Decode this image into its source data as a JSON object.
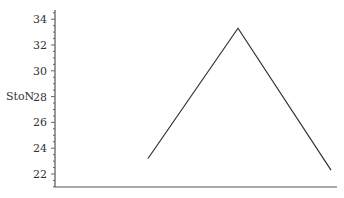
{
  "chart_data": {
    "type": "line",
    "title": "",
    "xlabel": "",
    "ylabel": "StoN",
    "ylim": [
      21,
      35
    ],
    "yticks": [
      22,
      24,
      26,
      28,
      30,
      32,
      34
    ],
    "grid": false,
    "legend": null,
    "series": [
      {
        "name": "StoN",
        "x": [
          1,
          2,
          3
        ],
        "values": [
          23.2,
          33.3,
          22.3
        ],
        "color": "#333333"
      }
    ]
  }
}
